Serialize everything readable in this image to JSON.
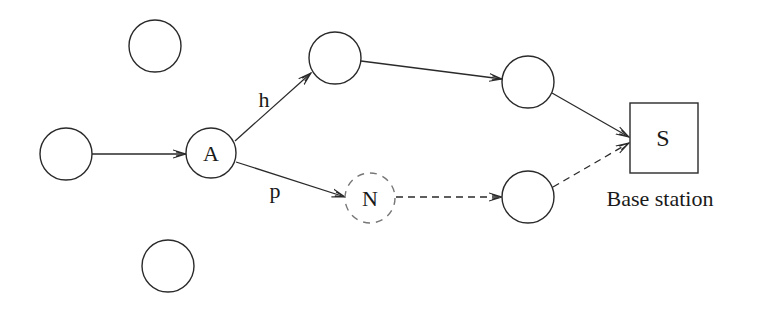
{
  "diagram": {
    "type": "network-routing",
    "nodes": [
      {
        "id": "iso_top",
        "label": "",
        "cx": 155,
        "cy": 46,
        "r": 26,
        "style": "solid"
      },
      {
        "id": "src",
        "label": "",
        "cx": 66,
        "cy": 154,
        "r": 26,
        "style": "solid"
      },
      {
        "id": "A",
        "label": "A",
        "cx": 211,
        "cy": 153,
        "r": 25,
        "style": "solid"
      },
      {
        "id": "B",
        "label": "",
        "cx": 335,
        "cy": 58,
        "r": 26,
        "style": "solid"
      },
      {
        "id": "C",
        "label": "",
        "cx": 528,
        "cy": 82,
        "r": 26,
        "style": "solid"
      },
      {
        "id": "N",
        "label": "N",
        "cx": 370,
        "cy": 198,
        "r": 25,
        "style": "dashed"
      },
      {
        "id": "D",
        "label": "",
        "cx": 528,
        "cy": 197,
        "r": 26,
        "style": "solid"
      },
      {
        "id": "iso_bottom",
        "label": "",
        "cx": 168,
        "cy": 266,
        "r": 26,
        "style": "solid"
      }
    ],
    "base_station": {
      "label": "S",
      "caption": "Base station",
      "x": 630,
      "y": 103,
      "w": 68,
      "h": 70
    },
    "edges": [
      {
        "from": "src",
        "to": "A",
        "label": "",
        "style": "solid"
      },
      {
        "from": "A",
        "to": "B",
        "label": "h",
        "style": "solid"
      },
      {
        "from": "B",
        "to": "C",
        "label": "",
        "style": "solid"
      },
      {
        "from": "C",
        "to": "S",
        "label": "",
        "style": "solid"
      },
      {
        "from": "A",
        "to": "N",
        "label": "p",
        "style": "solid"
      },
      {
        "from": "N",
        "to": "D",
        "label": "",
        "style": "dashed"
      },
      {
        "from": "D",
        "to": "S",
        "label": "",
        "style": "dashed"
      }
    ],
    "edge_labels": {
      "h": "h",
      "p": "p"
    },
    "colors": {
      "stroke": "#2a2a2a",
      "dashed_node": "#777777",
      "background": "#ffffff"
    }
  }
}
